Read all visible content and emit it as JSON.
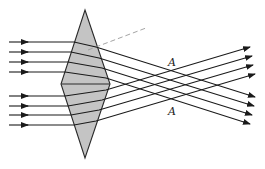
{
  "diagram": {
    "colors": {
      "lens_fill": "#c4c4c4",
      "stroke": "#1a1a1a",
      "background": "#ffffff",
      "dashed": "#9a9a9a"
    },
    "lens": {
      "shape": "rhombus",
      "vertices": {
        "top": [
          85,
          10
        ],
        "right": [
          110,
          84
        ],
        "bottom": [
          85,
          158
        ],
        "left": [
          61,
          84
        ]
      }
    },
    "labels": [
      {
        "text": "A",
        "x": 168,
        "y": 66
      },
      {
        "text": "A",
        "x": 168,
        "y": 115
      }
    ],
    "incoming_rays_y": [
      42,
      52,
      62,
      72,
      96,
      106,
      115,
      125
    ],
    "outgoing_rays": {
      "upper_group_direction": "downward",
      "lower_group_direction": "upward"
    }
  }
}
